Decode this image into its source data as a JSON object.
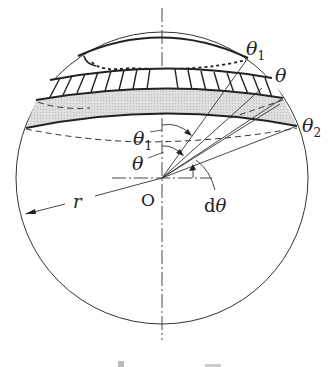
{
  "diagram": {
    "labels": {
      "theta1_top": "θ",
      "theta1_top_sub": "1",
      "theta_top": "θ",
      "theta2": "θ",
      "theta2_sub": "2",
      "theta1_angle": "θ",
      "theta1_angle_sub": "1",
      "theta_angle": "θ",
      "origin": "O",
      "radius": "r",
      "dtheta_d": "d",
      "dtheta_theta": "θ"
    },
    "caption": "",
    "colors": {
      "line": "#222222",
      "band_fill": "#d9d9d9",
      "background": "#ffffff"
    }
  }
}
